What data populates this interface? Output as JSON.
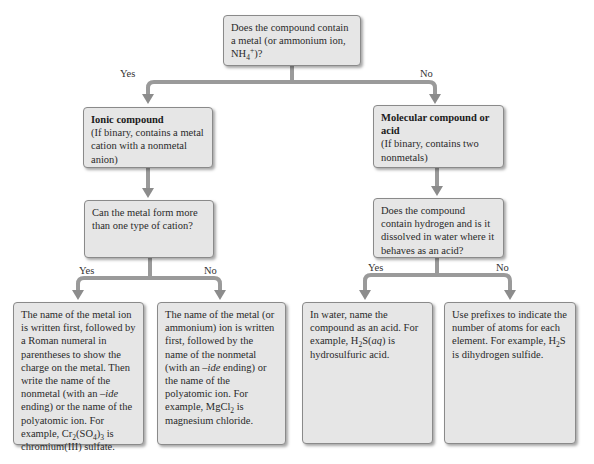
{
  "diagram": {
    "type": "decision flowchart",
    "topic": "Naming chemical compounds",
    "colors": {
      "box_fill": "#e6e6e6",
      "box_border": "#8a8a8a",
      "arrow": "#8c8c8c",
      "text": "#2a2a2a"
    },
    "root": {
      "question_pre": "Does the compound contain a metal (or ammonium ion, NH",
      "question_sub": "4",
      "question_sup": "+",
      "question_post": ")?"
    },
    "branch_labels": {
      "yes": "Yes",
      "no": "No"
    },
    "ionic": {
      "title": "Ionic compound",
      "desc": "(If binary, contains a metal cation with a nonmetal anion)",
      "question": "Can the metal form more than one type of cation?",
      "yes_result": {
        "text_1": "The name of the metal ion is written first, followed by a Roman numeral in parentheses to show the charge on the metal. Then write the name of the nonmetal (with an ",
        "ide": "–ide",
        "text_2": " ending) or the name of the polyatomic ion. For example, Cr",
        "sub_1": "2",
        "text_3": "(SO",
        "sub_2": "4",
        "text_4": ")",
        "sub_3": "3",
        "text_5": " is chromium(III) sulfate."
      },
      "no_result": {
        "text_1": "The name of the metal (or ammonium) ion is written first, followed by the name of the nonmetal (with an ",
        "ide": "–ide",
        "text_2": " ending) or the name of the polyatomic ion. For example, MgCl",
        "sub_1": "2",
        "text_3": " is magnesium chloride."
      }
    },
    "molecular": {
      "title": "Molecular compound or acid",
      "desc": "(If binary, contains two nonmetals)",
      "question": "Does the compound contain hydrogen and is it dissolved in water where it behaves as an acid?",
      "yes_result": {
        "text_1": "In water, name the compound as an acid. For example, H",
        "sub_1": "2",
        "text_2": "S(",
        "aq": "aq",
        "text_3": ") is hydrosulfuric acid."
      },
      "no_result": {
        "text_1": "Use prefixes to indicate the number of atoms for each element. For example, H",
        "sub_1": "2",
        "text_2": "S is dihydrogen sulfide."
      }
    }
  }
}
